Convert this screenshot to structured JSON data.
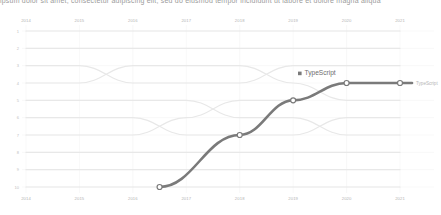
{
  "top_cut_text": "ipsum dolor sit amet, consectetur adipiscing elit, sed do eiusmod tempor incididunt ut labore et dolore magna aliqua",
  "chart_data": {
    "type": "line",
    "subtype": "bump",
    "title": "",
    "xlabel": "",
    "ylabel": "",
    "x": [
      2014,
      2015,
      2016,
      2017,
      2018,
      2019,
      2020,
      2021
    ],
    "xtick_labels": [
      "2014",
      "2015",
      "2016",
      "2017",
      "2018",
      "2019",
      "2020",
      "2021"
    ],
    "xtick_labels_bottom": [
      "2014",
      "2015",
      "2016",
      "2017",
      "2018",
      "2019",
      "2020",
      "2021"
    ],
    "ytick_labels": [
      "1",
      "2",
      "3",
      "4",
      "5",
      "6",
      "7",
      "8",
      "9",
      "10"
    ],
    "ylim": [
      1,
      10
    ],
    "y_inverted": true,
    "grid": true,
    "legend_position": "inside-top-right",
    "axis_labels_top": true,
    "axis_labels_bottom": true,
    "highlight_color": "#7a7a7a",
    "background_line_color": "#e8e8e8",
    "gridline_color": "#f0f0f0",
    "node_fill": "#ffffff",
    "series": [
      {
        "name": "TypeScript",
        "highlighted": true,
        "legend_label": "TypeScript",
        "end_label": "TypeScript",
        "x": [
          2016.5,
          2018,
          2019,
          2020,
          2021
        ],
        "values": [
          10,
          7,
          5,
          4,
          4
        ]
      },
      {
        "name": "background-line-1",
        "highlighted": false,
        "x": [
          2014,
          2015,
          2016,
          2017,
          2018,
          2019,
          2020,
          2021
        ],
        "values": [
          3,
          3,
          4,
          4,
          4,
          3,
          3,
          3
        ]
      },
      {
        "name": "background-line-2",
        "highlighted": false,
        "x": [
          2014,
          2015,
          2016,
          2017,
          2018,
          2019,
          2020,
          2021
        ],
        "values": [
          4,
          4,
          3,
          3,
          3,
          4,
          5,
          5
        ]
      },
      {
        "name": "background-line-3",
        "highlighted": false,
        "x": [
          2014,
          2015,
          2016,
          2017,
          2018,
          2019,
          2020,
          2021
        ],
        "values": [
          2,
          2,
          2,
          2,
          2,
          2,
          2,
          2
        ]
      },
      {
        "name": "background-line-4",
        "highlighted": false,
        "x": [
          2014,
          2015,
          2016,
          2017,
          2018,
          2019,
          2020,
          2021
        ],
        "values": [
          1,
          1,
          1,
          1,
          1,
          1,
          1,
          1
        ]
      },
      {
        "name": "background-line-5",
        "highlighted": false,
        "x": [
          2014,
          2015,
          2016,
          2017,
          2018,
          2019,
          2020,
          2021
        ],
        "values": [
          6,
          6,
          6,
          7,
          7,
          7,
          6,
          6
        ]
      },
      {
        "name": "background-line-6",
        "highlighted": false,
        "x": [
          2014,
          2015,
          2016,
          2017,
          2018,
          2019,
          2020,
          2021
        ],
        "values": [
          5,
          5,
          5,
          5,
          6,
          6,
          7,
          7
        ]
      },
      {
        "name": "background-line-7",
        "highlighted": false,
        "x": [
          2014,
          2015,
          2016,
          2017,
          2018,
          2019,
          2020,
          2021
        ],
        "values": [
          7,
          7,
          7,
          6,
          5,
          5,
          4,
          4
        ]
      },
      {
        "name": "background-line-8",
        "highlighted": false,
        "x": [
          2014,
          2015,
          2016,
          2017,
          2018,
          2019,
          2020,
          2021
        ],
        "values": [
          8,
          8,
          8,
          8,
          8,
          8,
          8,
          8
        ]
      },
      {
        "name": "background-line-9",
        "highlighted": false,
        "x": [
          2014,
          2015,
          2016,
          2017,
          2018,
          2019,
          2020,
          2021
        ],
        "values": [
          9,
          9,
          9,
          9,
          9,
          9,
          9,
          9
        ]
      },
      {
        "name": "background-line-10",
        "highlighted": false,
        "x": [
          2014,
          2015,
          2016,
          2017,
          2018,
          2019,
          2020,
          2021
        ],
        "values": [
          10,
          10,
          10,
          10,
          10,
          10,
          10,
          10
        ]
      }
    ]
  }
}
